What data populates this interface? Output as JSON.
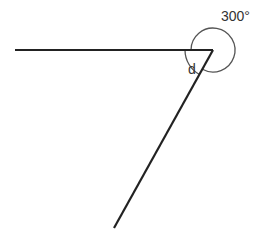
{
  "diagram": {
    "type": "angle-diagram",
    "labels": {
      "reflex_angle": "300°",
      "unknown_angle": "d"
    },
    "colors": {
      "line": "#222222",
      "arc": "#555555",
      "text": "#333333"
    },
    "geometry": {
      "vertex": [
        213,
        50
      ],
      "ray_horizontal_end": [
        15,
        50
      ],
      "ray_slanted_end": [
        114,
        228
      ],
      "reflex_arc_radius": 22,
      "inner_arc_radius": 28
    }
  }
}
